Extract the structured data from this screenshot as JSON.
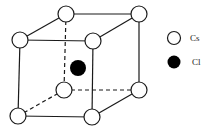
{
  "diagram": {
    "colors": {
      "line": "#1a1a1a",
      "cs_fill": "#ffffff",
      "cl_fill": "#000000"
    },
    "cs_atoms": [
      {
        "id": "back-top-left",
        "x": 66,
        "y": 14
      },
      {
        "id": "back-top-right",
        "x": 139,
        "y": 14
      },
      {
        "id": "front-top-left",
        "x": 20,
        "y": 40
      },
      {
        "id": "front-top-right",
        "x": 93,
        "y": 41
      },
      {
        "id": "back-bottom-left",
        "x": 64,
        "y": 90
      },
      {
        "id": "back-bottom-right",
        "x": 139,
        "y": 90
      },
      {
        "id": "front-bottom-left",
        "x": 18,
        "y": 116
      },
      {
        "id": "front-bottom-right",
        "x": 92,
        "y": 117
      }
    ],
    "cl_atom": {
      "x": 78,
      "y": 68
    },
    "atom_radius": 8
  },
  "legend": {
    "items": [
      {
        "symbol": "open-circle",
        "label": "Cs"
      },
      {
        "symbol": "filled-circle",
        "label": "Cl"
      }
    ]
  }
}
